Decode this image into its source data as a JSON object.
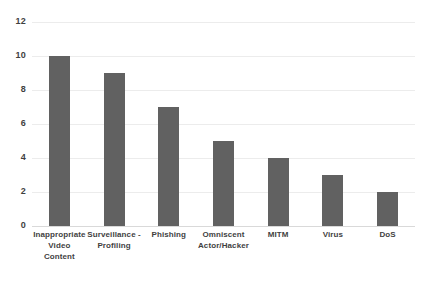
{
  "chart_data": {
    "type": "bar",
    "title": "",
    "subtitle": "",
    "xlabel": "",
    "ylabel": "",
    "categories": [
      "Inappropriate Video Content",
      "Surveillance - Profiling",
      "Phishing",
      "Omniscent Actor/Hacker",
      "MITM",
      "Virus",
      "DoS"
    ],
    "category_display": [
      "Inappropriate\nVideo\nContent",
      "Surveillance -\nProfiling",
      "Phishing",
      "Omniscent\nActor/Hacker",
      "MITM",
      "Virus",
      "DoS"
    ],
    "values": [
      10,
      9,
      7,
      5,
      4,
      3,
      2
    ],
    "ylim": [
      0,
      12
    ],
    "ytick_labels": [
      "12",
      "10",
      "8",
      "6",
      "4",
      "2",
      "0"
    ],
    "ytick_values": [
      12,
      10,
      8,
      6,
      4,
      2,
      0
    ],
    "grid": true,
    "legend": false,
    "legend_position": "none",
    "bar_color": "#616161",
    "gridline_color": "#ececec",
    "background_color": "#ffffff",
    "text_color": "#3f3f3f"
  }
}
